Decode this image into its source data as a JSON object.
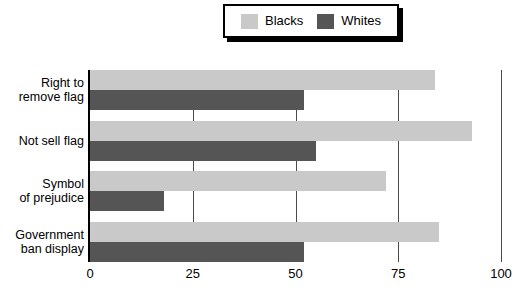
{
  "legend": {
    "entries": [
      {
        "label": "Blacks",
        "color": "#c9c9c9"
      },
      {
        "label": "Whites",
        "color": "#555555"
      }
    ]
  },
  "axis": {
    "x_ticks": [
      "0",
      "25",
      "50",
      "75",
      "100"
    ]
  },
  "categories": [
    {
      "line1": "Right to",
      "line2": "remove flag"
    },
    {
      "line1": "Not sell flag",
      "line2": ""
    },
    {
      "line1": "Symbol",
      "line2": "of prejudice"
    },
    {
      "line1": "Government",
      "line2": "ban display"
    }
  ],
  "chart_data": {
    "type": "bar",
    "orientation": "horizontal",
    "title": "",
    "xlabel": "",
    "ylabel": "",
    "xlim": [
      0,
      100
    ],
    "grid": true,
    "legend_position": "top",
    "categories": [
      "Right to remove flag",
      "Not sell flag",
      "Symbol of prejudice",
      "Government ban display"
    ],
    "series": [
      {
        "name": "Blacks",
        "color": "#c9c9c9",
        "values": [
          84,
          93,
          72,
          85
        ]
      },
      {
        "name": "Whites",
        "color": "#555555",
        "values": [
          52,
          55,
          18,
          52
        ]
      }
    ],
    "tick_values": [
      0,
      25,
      50,
      75,
      100
    ]
  }
}
